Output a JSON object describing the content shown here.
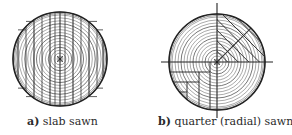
{
  "figures": [
    {
      "id": "a",
      "tag": "a)",
      "label": " slab sawn",
      "method": "slab sawn",
      "log": {
        "cx": 60,
        "cy": 59,
        "r": 47
      },
      "ring_count": 16,
      "board_cut_x": [
        18,
        26,
        34,
        42,
        50,
        55,
        60,
        65,
        73,
        81,
        89,
        97,
        103
      ]
    },
    {
      "id": "b",
      "tag": "b)",
      "label": " quarter (radial) sawn",
      "method": "quarter (radial) sawn",
      "log": {
        "cx": 71,
        "cy": 62,
        "r": 48
      },
      "ring_count": 16,
      "axes": {
        "horizontal": [
          15,
          127
        ],
        "vertical": [
          3,
          118
        ]
      }
    }
  ],
  "colors": {
    "line": "#333333",
    "ring": "#555555",
    "outline": "#222222",
    "background": "#ffffff"
  }
}
